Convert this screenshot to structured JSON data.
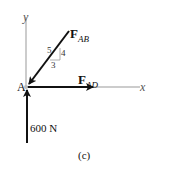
{
  "figure": {
    "caption": "(c)",
    "point_label": "A",
    "axes": {
      "x_label": "x",
      "y_label": "y"
    },
    "forces": [
      {
        "id": "F_AB",
        "symbol": "F",
        "subscript": "AB",
        "direction": "down-left toward A, slope 3-4-5"
      },
      {
        "id": "F_AD",
        "symbol": "F",
        "subscript": "AD",
        "direction": "along +x"
      },
      {
        "id": "600N",
        "label": "600 N",
        "direction": "upward along +y into A"
      }
    ],
    "slope_triangle": {
      "hypotenuse": "5",
      "vertical": "4",
      "horizontal": "3"
    }
  }
}
